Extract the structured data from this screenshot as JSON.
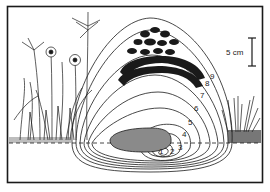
{
  "figure": {
    "type": "line illustration",
    "colors": {
      "ink": "#1a1a1a",
      "background": "#ffffff"
    }
  },
  "scale_bar": {
    "label": "5 cm"
  },
  "contours": {
    "labels": [
      "1",
      "2",
      "3",
      "4",
      "5",
      "6",
      "7",
      "8",
      "9"
    ]
  },
  "elements": {
    "stone": "buried stone",
    "ground_line": "dashed surface line",
    "vegetation_left": "grasses and daisy-like flowers",
    "vegetation_right": "grass tufts",
    "cap": "dark aggregated clods at top of mound"
  }
}
